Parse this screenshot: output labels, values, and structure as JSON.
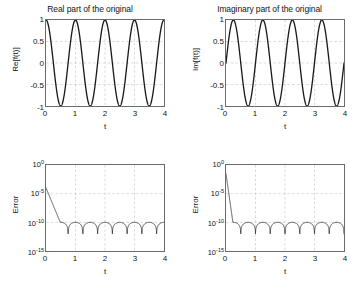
{
  "figure": {
    "layout": "2x2 subplot grid",
    "background_color": "#ffffff",
    "curve_color": "#1a1a1a",
    "grid_color": "#b4b4b4",
    "axis_color": "#6b6b6b"
  },
  "panels": {
    "real": {
      "title": "Real part of the original",
      "ylabel": "Re[f(t)]",
      "xlabel": "t",
      "yticks": [
        "1",
        "0.5",
        "0",
        "-0.5",
        "-1"
      ],
      "xticks": [
        "0",
        "1",
        "2",
        "3",
        "4"
      ]
    },
    "imag": {
      "title": "Imaginary part of the original",
      "ylabel": "Im[f(t)]",
      "xlabel": "t",
      "yticks": [
        "1",
        "0.5",
        "0",
        "-0.5",
        "-1"
      ],
      "xticks": [
        "0",
        "1",
        "2",
        "3",
        "4"
      ]
    },
    "error_real": {
      "title": "",
      "ylabel": "Error",
      "xlabel": "t",
      "yticks": [
        "10",
        "10",
        "10",
        "10"
      ],
      "ytick_exponents": [
        "0",
        "-5",
        "-10",
        "-15"
      ],
      "xticks": [
        "0",
        "1",
        "2",
        "3",
        "4"
      ]
    },
    "error_imag": {
      "title": "",
      "ylabel": "Error",
      "xlabel": "t",
      "yticks": [
        "10",
        "10",
        "10",
        "10"
      ],
      "ytick_exponents": [
        "0",
        "-5",
        "-10",
        "-15"
      ],
      "xticks": [
        "0",
        "1",
        "2",
        "3",
        "4"
      ]
    }
  },
  "chart_data": [
    {
      "type": "line",
      "id": "real-part",
      "title": "Real part of the original",
      "xlabel": "t",
      "ylabel": "Re[f(t)]",
      "xlim": [
        0,
        4
      ],
      "ylim": [
        -1,
        1
      ],
      "xticks": [
        0,
        1,
        2,
        3,
        4
      ],
      "yticks": [
        -1,
        -0.5,
        0,
        0.5,
        1
      ],
      "grid": true,
      "legend": null,
      "series": [
        {
          "name": "Re[f(t)] = cos(2*pi*t)",
          "function": "cos(2*pi*t)",
          "period": 1.0,
          "amplitude": 1.0,
          "phase": 0.0,
          "x": [
            0,
            0.25,
            0.5,
            0.75,
            1,
            1.25,
            1.5,
            1.75,
            2,
            2.25,
            2.5,
            2.75,
            3,
            3.25,
            3.5,
            3.75,
            4
          ],
          "values": [
            1,
            0,
            -1,
            0,
            1,
            0,
            -1,
            0,
            1,
            0,
            -1,
            0,
            1,
            0,
            -1,
            0,
            1
          ]
        }
      ]
    },
    {
      "type": "line",
      "id": "imaginary-part",
      "title": "Imaginary part of the original",
      "xlabel": "t",
      "ylabel": "Im[f(t)]",
      "xlim": [
        0,
        4
      ],
      "ylim": [
        -1,
        1
      ],
      "xticks": [
        0,
        1,
        2,
        3,
        4
      ],
      "yticks": [
        -1,
        -0.5,
        0,
        0.5,
        1
      ],
      "grid": true,
      "legend": null,
      "series": [
        {
          "name": "Im[f(t)] = sin(2*pi*t)",
          "function": "sin(2*pi*t)",
          "period": 1.0,
          "amplitude": 1.0,
          "phase": 0.0,
          "x": [
            0,
            0.25,
            0.5,
            0.75,
            1,
            1.25,
            1.5,
            1.75,
            2,
            2.25,
            2.5,
            2.75,
            3,
            3.25,
            3.5,
            3.75,
            4
          ],
          "values": [
            0,
            1,
            0,
            -1,
            0,
            1,
            0,
            -1,
            0,
            1,
            0,
            -1,
            0,
            1,
            0,
            -1,
            0
          ]
        }
      ]
    },
    {
      "type": "line",
      "id": "error-real",
      "title": "",
      "xlabel": "t",
      "ylabel": "Error",
      "xlim": [
        0,
        4
      ],
      "ylim": [
        1e-15,
        1
      ],
      "yscale": "log",
      "xticks": [
        0,
        1,
        2,
        3,
        4
      ],
      "yticks": [
        1,
        1e-05,
        1e-10,
        1e-15
      ],
      "ytick_labels": [
        "10^0",
        "10^-5",
        "10^-10",
        "10^-15"
      ],
      "grid": true,
      "legend": null,
      "series": [
        {
          "name": "absolute error of real part",
          "description": "starts near 1e-4 at t=0, decays to a plateau near 1e-10 with periodic downward cusps to about 1e-12",
          "plateau": 1e-10,
          "cusp_floor": 1e-12,
          "cusp_period": 0.5,
          "x": [
            0,
            0.05,
            0.1,
            0.15,
            0.2,
            0.25,
            0.3,
            0.5,
            0.75,
            1.0,
            1.25,
            1.5,
            1.75,
            2.0,
            2.25,
            2.5,
            2.75,
            3.0,
            3.25,
            3.5,
            3.75,
            4.0
          ],
          "values": [
            0.0001,
            2e-06,
            3e-08,
            4e-10,
            1.2e-10,
            9e-11,
            8.5e-11,
            8e-11,
            2e-12,
            9e-11,
            3e-12,
            9e-11,
            3e-12,
            9.5e-11,
            3e-12,
            9.5e-11,
            3e-12,
            1e-10,
            3e-12,
            1e-10,
            3e-12,
            1e-10
          ]
        }
      ]
    },
    {
      "type": "line",
      "id": "error-imaginary",
      "title": "",
      "xlabel": "t",
      "ylabel": "Error",
      "xlim": [
        0,
        4
      ],
      "ylim": [
        1e-15,
        1
      ],
      "yscale": "log",
      "xticks": [
        0,
        1,
        2,
        3,
        4
      ],
      "yticks": [
        1,
        1e-05,
        1e-10,
        1e-15
      ],
      "ytick_labels": [
        "10^0",
        "10^-5",
        "10^-10",
        "10^-15"
      ],
      "grid": true,
      "legend": null,
      "series": [
        {
          "name": "absolute error of imaginary part",
          "description": "drops almost vertically from above 1e-2 at t=0 to a plateau near 1e-10, with regular downward cusps to about 1e-12 every 0.5",
          "plateau": 1e-10,
          "cusp_floor": 1e-12,
          "cusp_period": 0.5,
          "x": [
            0,
            0.03,
            0.06,
            0.1,
            0.25,
            0.5,
            0.75,
            1.0,
            1.25,
            1.5,
            1.75,
            2.0,
            2.25,
            2.5,
            2.75,
            3.0,
            3.25,
            3.5,
            3.75,
            4.0
          ],
          "values": [
            0.03,
            1e-05,
            5e-09,
            9e-11,
            8e-11,
            3e-12,
            9e-11,
            3e-12,
            9e-11,
            3e-12,
            9.5e-11,
            3e-12,
            9.5e-11,
            3e-12,
            1e-10,
            3e-12,
            1e-10,
            3e-12,
            1e-10,
            5e-11
          ]
        }
      ]
    }
  ]
}
